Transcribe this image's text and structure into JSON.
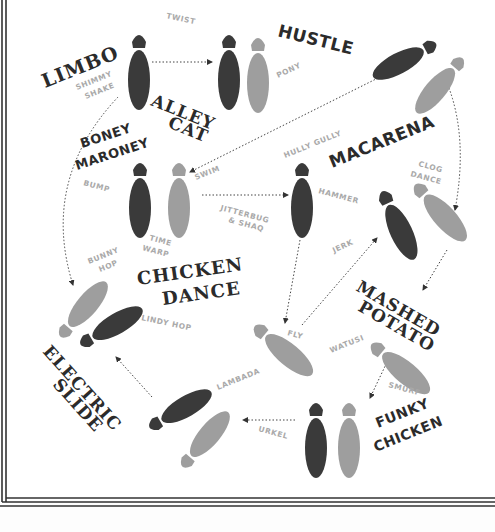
{
  "diagram": {
    "dances": [
      {
        "id": "limbo",
        "label": "LIMBO"
      },
      {
        "id": "hustle",
        "label": "HUSTLE"
      },
      {
        "id": "alley_cat",
        "label_line1": "ALLEY",
        "label_line2": "CAT"
      },
      {
        "id": "boney_maroney",
        "label_line1": "BONEY",
        "label_line2": "MARONEY"
      },
      {
        "id": "macarena",
        "label": "MACARENA"
      },
      {
        "id": "chicken_dance",
        "label_line1": "CHICKEN",
        "label_line2": "DANCE"
      },
      {
        "id": "mashed_potato",
        "label_line1": "MASHED",
        "label_line2": "POTATO"
      },
      {
        "id": "electric_slide",
        "label_line1": "ELECTRIC",
        "label_line2": "SLIDE"
      },
      {
        "id": "funky_chicken",
        "label_line1": "FUNKY",
        "label_line2": "CHICKEN"
      }
    ],
    "moves": {
      "twist": "TWIST",
      "pony": "PONY",
      "shimmy_l1": "SHIMMY",
      "shimmy_l2": "SHAKE",
      "hully_gully": "HULLY GULLY",
      "swim": "SWIM",
      "bump": "BUMP",
      "hammer": "HAMMER",
      "clog_l1": "CLOG",
      "clog_l2": "DANCE",
      "jitterbug_l1": "JITTERBUG",
      "jitterbug_l2": "& SHAQ",
      "time_l1": "TIME",
      "time_l2": "WARP",
      "bunny_l1": "BUNNY",
      "bunny_l2": "HOP",
      "jerk": "JERK",
      "lindy_hop": "LINDY HOP",
      "fly": "FLY",
      "watusi": "WATUSI",
      "lambada": "LAMBADA",
      "smurf": "SMURF",
      "urkel": "URKEL"
    },
    "colors": {
      "dark_footprint": "#3a3a3a",
      "light_footprint": "#9e9e9e",
      "move_label": "#a9a9a9",
      "title_text": "#2b2b2b",
      "border": "#333333"
    }
  }
}
